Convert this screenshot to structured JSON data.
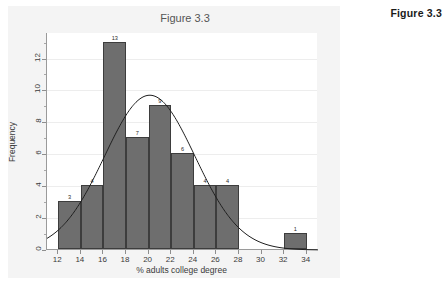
{
  "side_caption": "Figure 3.3",
  "chart_data": {
    "type": "bar",
    "title": "Figure 3.3",
    "xlabel": "% adults college degree",
    "ylabel": "Frequency",
    "xlim": [
      11,
      35
    ],
    "ylim": [
      0,
      13.6
    ],
    "grid": true,
    "legend": "none",
    "bin_width": 2,
    "bins": [
      {
        "start": 12,
        "end": 14,
        "value": 3,
        "label": "3"
      },
      {
        "start": 14,
        "end": 16,
        "value": 4,
        "label": "4"
      },
      {
        "start": 16,
        "end": 18,
        "value": 13,
        "label": "13"
      },
      {
        "start": 18,
        "end": 20,
        "value": 7,
        "label": "7"
      },
      {
        "start": 20,
        "end": 22,
        "value": 9,
        "label": "9"
      },
      {
        "start": 22,
        "end": 24,
        "value": 6,
        "label": "6"
      },
      {
        "start": 24,
        "end": 26,
        "value": 4,
        "label": "4"
      },
      {
        "start": 26,
        "end": 28,
        "value": 4,
        "label": "4"
      },
      {
        "start": 32,
        "end": 34,
        "value": 1,
        "label": "1"
      }
    ],
    "categories": [
      "12-14",
      "14-16",
      "16-18",
      "18-20",
      "20-22",
      "22-24",
      "24-26",
      "26-28",
      "32-34"
    ],
    "values": [
      3,
      4,
      13,
      7,
      9,
      6,
      4,
      4,
      1
    ],
    "xticks": [
      12,
      14,
      16,
      18,
      20,
      22,
      24,
      26,
      28,
      30,
      32,
      34
    ],
    "xtick_labels": [
      "12",
      "14",
      "16",
      "18",
      "20",
      "22",
      "24",
      "26",
      "28",
      "30",
      "32",
      "34"
    ],
    "yticks": [
      0,
      2,
      4,
      6,
      8,
      10,
      12
    ],
    "ytick_labels": [
      "0",
      "2",
      "4",
      "6",
      "8",
      "10",
      "12"
    ],
    "overlay": {
      "type": "line",
      "name": "normal density curve",
      "mean": 20.1,
      "sd": 4.0,
      "peak_value": 9.7,
      "color": "#1f1f1f"
    },
    "colors": {
      "bar_fill": "#6e6e6e",
      "bar_edge": "#3d3d3d",
      "plot_background": "#ffffff",
      "page_background": "#f2f2f2",
      "gridline": "#ededed",
      "axis": "#9a9a9a",
      "text": "#3a3a3a"
    }
  }
}
